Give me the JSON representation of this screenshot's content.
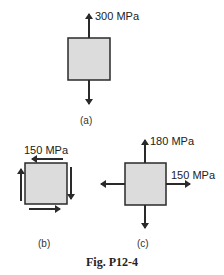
{
  "figure": {
    "caption": "Fig. P12-4",
    "colors": {
      "element_fill": "#dcdcdc",
      "stroke": "#2a2a2a",
      "background": "#ffffff"
    },
    "panels": [
      {
        "id": "a",
        "label": "(a)",
        "stresses": [
          {
            "type": "normal-vertical",
            "value_label": "300 MPa"
          }
        ]
      },
      {
        "id": "b",
        "label": "(b)",
        "stresses": [
          {
            "type": "shear",
            "value_label": "150 MPa"
          }
        ]
      },
      {
        "id": "c",
        "label": "(c)",
        "stresses": [
          {
            "type": "normal-vertical",
            "value_label": "180 MPa"
          },
          {
            "type": "normal-horizontal",
            "value_label": "150 MPa"
          }
        ]
      }
    ]
  }
}
